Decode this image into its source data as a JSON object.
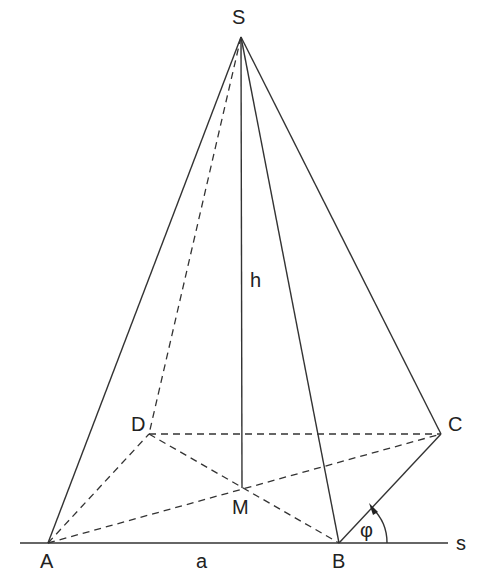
{
  "figure": {
    "type": "pyramid",
    "stroke_color": "#333333",
    "background": "#ffffff"
  },
  "points": {
    "S": {
      "label": "S",
      "x": 241,
      "y": 37
    },
    "A": {
      "label": "A",
      "x": 48,
      "y": 543
    },
    "B": {
      "label": "B",
      "x": 339,
      "y": 543
    },
    "C": {
      "label": "C",
      "x": 441,
      "y": 434
    },
    "D": {
      "label": "D",
      "x": 149,
      "y": 434
    },
    "M": {
      "label": "M",
      "x": 242,
      "y": 488
    }
  },
  "labels": {
    "S": "S",
    "A": "A",
    "B": "B",
    "C": "C",
    "D": "D",
    "M": "M",
    "height": "h",
    "edge": "a",
    "angle": "φ",
    "line": "s"
  },
  "edges": {
    "solid": [
      "SA",
      "SB",
      "SC",
      "AB",
      "BC",
      "SM"
    ],
    "dashed": [
      "SD",
      "AD",
      "DC",
      "AC",
      "DB"
    ]
  }
}
